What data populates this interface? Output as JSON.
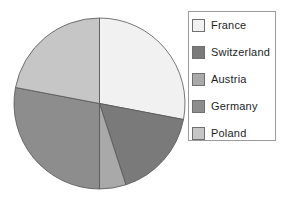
{
  "chart_data": {
    "type": "pie",
    "title": "",
    "labels": [
      "France",
      "Switzerland",
      "Austria",
      "Germany",
      "Poland"
    ],
    "values": [
      28,
      17,
      5,
      28,
      22
    ],
    "unit": "percent",
    "start_angle_deg": 0,
    "direction": "clockwise",
    "colors": [
      "#f2f1f2",
      "#7a7a7a",
      "#a9a9a9",
      "#8d8d8d",
      "#c6c6c6"
    ],
    "outline_color": "#545454",
    "background_color": "#ffffff",
    "legend_position": "upper right",
    "legend_border_color": "#9a9a9a",
    "swatch_border_color": "#6f6f6f",
    "text_color": "#1e1e1e"
  }
}
